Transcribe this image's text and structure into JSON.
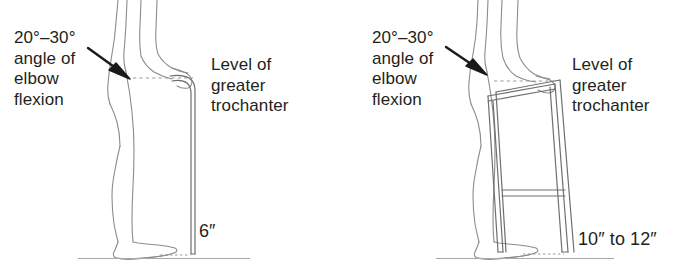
{
  "figure": {
    "colors": {
      "text": "#231f20",
      "line": "#6f6f72",
      "body_line": "#8b8b90",
      "arrow": "#1a1a1a",
      "ground": "#a9a9ad",
      "background": "#ffffff"
    }
  },
  "panels": [
    {
      "name": "cane",
      "elbow_label": "20°–30°\nangle of\nelbow\nflexion",
      "trochanter_label": "Level of\ngreater\ntrochanter",
      "measurement": "6″",
      "arrow_name": "elbow-flexion-arrow",
      "device": "cane"
    },
    {
      "name": "walker",
      "elbow_label": "20°–30°\nangle of\nelbow\nflexion",
      "trochanter_label": "Level of\ngreater\ntrochanter",
      "measurement": "10″ to 12″",
      "arrow_name": "elbow-flexion-arrow",
      "device": "walker"
    }
  ]
}
